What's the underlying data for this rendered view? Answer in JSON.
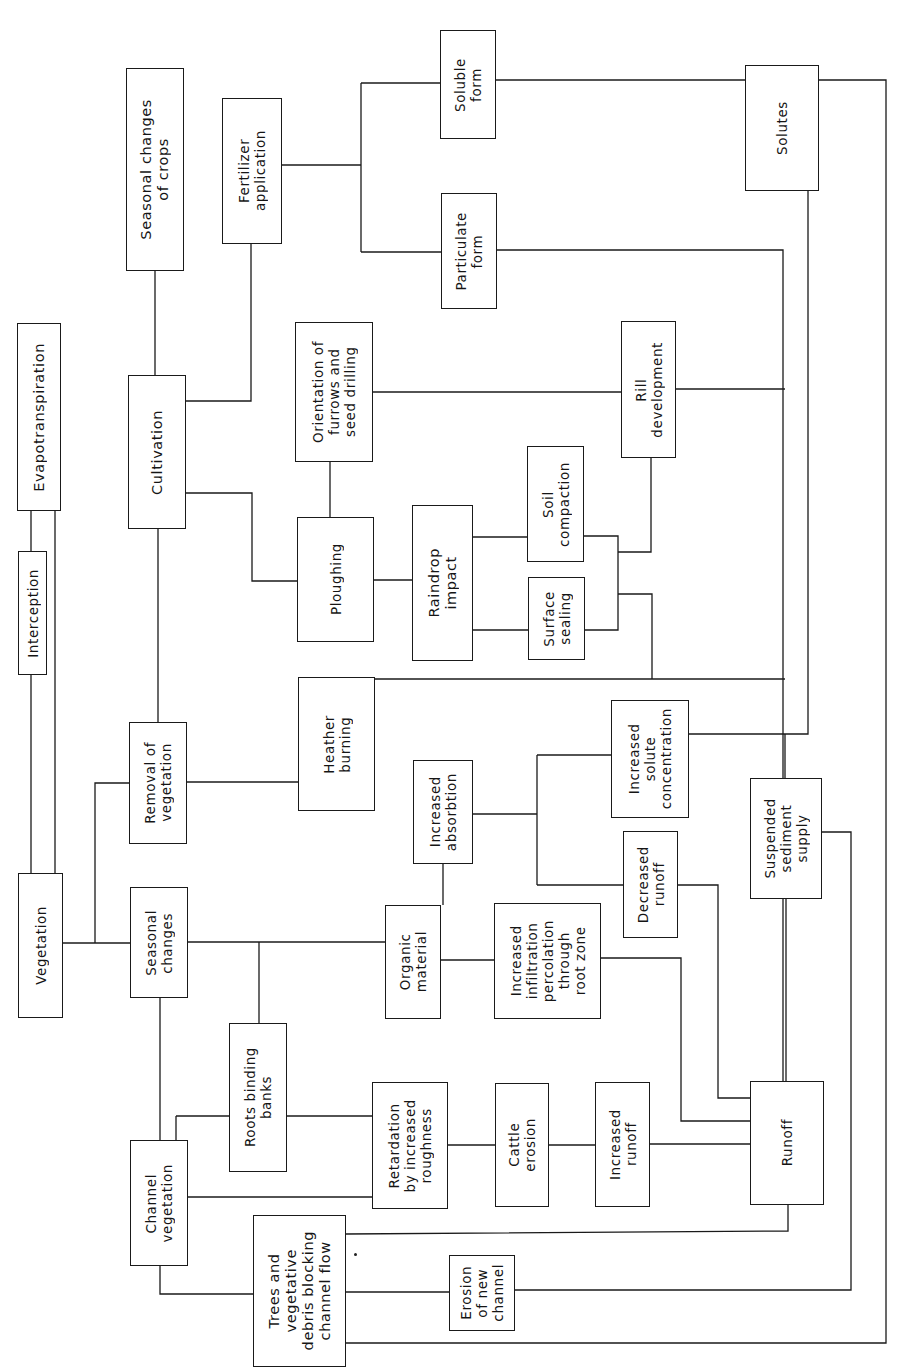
{
  "figure": {
    "orientation": "rotated 90° counter-clockwise (text reads bottom-to-top)",
    "line_color": "#1a1a1a",
    "background": "#ffffff"
  },
  "nodes": [
    {
      "id": "evapotranspiration",
      "label": "Evapotranspiration",
      "x": 17,
      "y": 323,
      "w": 44,
      "h": 188
    },
    {
      "id": "interception",
      "label": "Interception",
      "x": 18,
      "y": 551,
      "w": 29,
      "h": 124
    },
    {
      "id": "vegetation",
      "label": "Vegetation",
      "x": 18,
      "y": 873,
      "w": 45,
      "h": 145
    },
    {
      "id": "seasonal-changes-of-crops",
      "label": "Seasonal changes\nof crops",
      "x": 126,
      "y": 68,
      "w": 58,
      "h": 203
    },
    {
      "id": "cultivation",
      "label": "Cultivation",
      "x": 128,
      "y": 375,
      "w": 58,
      "h": 154
    },
    {
      "id": "removal-of-vegetation",
      "label": "Removal of\nvegetation",
      "x": 129,
      "y": 722,
      "w": 58,
      "h": 122
    },
    {
      "id": "seasonal-changes",
      "label": "Seasonal\nchanges",
      "x": 130,
      "y": 887,
      "w": 58,
      "h": 111
    },
    {
      "id": "channel-vegetation",
      "label": "Channel\nvegetation",
      "x": 130,
      "y": 1140,
      "w": 58,
      "h": 126
    },
    {
      "id": "fertilizer-application",
      "label": "Fertilizer\napplication",
      "x": 222,
      "y": 98,
      "w": 60,
      "h": 146
    },
    {
      "id": "orientation-of-furrows",
      "label": "Orientation of\nfurrows and\nseed drilling",
      "x": 295,
      "y": 322,
      "w": 78,
      "h": 140
    },
    {
      "id": "ploughing",
      "label": "Ploughing",
      "x": 297,
      "y": 517,
      "w": 77,
      "h": 125
    },
    {
      "id": "heather-burning",
      "label": "Heather\nburning",
      "x": 298,
      "y": 677,
      "w": 77,
      "h": 134
    },
    {
      "id": "roots-binding-banks",
      "label": "Roots binding\nbanks",
      "x": 229,
      "y": 1023,
      "w": 58,
      "h": 149
    },
    {
      "id": "trees-debris",
      "label": "Trees and\nvegetative\ndebris blocking\nchannel flow",
      "x": 253,
      "y": 1215,
      "w": 93,
      "h": 152
    },
    {
      "id": "soluble-form",
      "label": "Soluble\nform",
      "x": 440,
      "y": 30,
      "w": 56,
      "h": 109
    },
    {
      "id": "particulate-form",
      "label": "Particulate\nform",
      "x": 441,
      "y": 193,
      "w": 56,
      "h": 116
    },
    {
      "id": "raindrop-impact",
      "label": "Raindrop\nimpact",
      "x": 412,
      "y": 505,
      "w": 61,
      "h": 156
    },
    {
      "id": "soil-compaction",
      "label": "Soil\ncompaction",
      "x": 527,
      "y": 446,
      "w": 57,
      "h": 116
    },
    {
      "id": "surface-sealing",
      "label": "Surface\nsealing",
      "x": 528,
      "y": 577,
      "w": 57,
      "h": 83
    },
    {
      "id": "increased-absorbtion",
      "label": "Increased\nabsorbtion",
      "x": 413,
      "y": 760,
      "w": 60,
      "h": 104
    },
    {
      "id": "organic-material",
      "label": "Organic\nmaterial",
      "x": 385,
      "y": 905,
      "w": 56,
      "h": 114
    },
    {
      "id": "increased-infiltration",
      "label": "Increased\ninfiltration\npercolation\nthrough\nroot zone",
      "x": 494,
      "y": 903,
      "w": 107,
      "h": 116
    },
    {
      "id": "retardation",
      "label": "Retardation\nby increased\nroughness",
      "x": 372,
      "y": 1082,
      "w": 76,
      "h": 127
    },
    {
      "id": "cattle-erosion",
      "label": "Cattle\nerosion",
      "x": 495,
      "y": 1083,
      "w": 54,
      "h": 124
    },
    {
      "id": "increased-runoff",
      "label": "Increased\nrunoff",
      "x": 595,
      "y": 1082,
      "w": 55,
      "h": 125
    },
    {
      "id": "erosion-of-new-channel",
      "label": "Erosion\nof new\nchannel",
      "x": 449,
      "y": 1255,
      "w": 66,
      "h": 76
    },
    {
      "id": "rill-development",
      "label": "Rill\ndevelopment",
      "x": 621,
      "y": 321,
      "w": 55,
      "h": 137
    },
    {
      "id": "increased-solute-concentration",
      "label": "Increased\nsolute\nconcentration",
      "x": 611,
      "y": 700,
      "w": 78,
      "h": 118
    },
    {
      "id": "decreased-runoff",
      "label": "Decreased\nrunoff",
      "x": 623,
      "y": 831,
      "w": 55,
      "h": 107
    },
    {
      "id": "suspended-sediment-supply",
      "label": "Suspended\nsediment\nsupply",
      "x": 750,
      "y": 778,
      "w": 72,
      "h": 121
    },
    {
      "id": "solutes",
      "label": "Solutes",
      "x": 745,
      "y": 65,
      "w": 74,
      "h": 126
    },
    {
      "id": "runoff",
      "label": "Runoff",
      "x": 750,
      "y": 1081,
      "w": 74,
      "h": 124
    }
  ],
  "connectors": [
    "M 31 510 L 31 551",
    "M 55 510 L 55 873",
    "M 31 674 L 31 873",
    "M 63 943 L 130 943",
    "M 95 943 L 95 783 L 129 783",
    "M 155 270 L 155 375",
    "M 185 401 L 251 401 L 251 243",
    "M 186 493 L 252 493 L 252 581 L 297 581",
    "M 158 528 L 158 722",
    "M 187 782 L 298 782",
    "M 160 997 L 160 1140",
    "M 188 942 L 385 942",
    "M 259 942 L 259 1023",
    "M 282 165 L 361 165",
    "M 361 83 L 361 252",
    "M 361 83 L 440 83",
    "M 361 252 L 441 252",
    "M 373 392 L 621 392",
    "M 330 461 L 330 517",
    "M 374 580 L 412 580",
    "M 472 537 L 527 537",
    "M 472 630 L 528 630",
    "M 584 536 L 618 536 L 618 630 L 584 630",
    "M 618 552 L 651 552 L 651 457",
    "M 618 594 L 652 594 L 652 679",
    "M 375 679 L 785 679",
    "M 675 389 L 785 389",
    "M 496 250 L 783 250 L 783 1081",
    "M 496 80 L 745 80",
    "M 818 80 L 886 80 L 886 1343 L 346 1343",
    "M 808 190 L 808 734 L 688 734",
    "M 785 734 L 785 778",
    "M 473 814 L 537 814",
    "M 537 755 L 537 885",
    "M 537 755 L 611 755",
    "M 537 885 L 623 885",
    "M 678 885 L 718 885 L 718 1098 L 750 1098",
    "M 441 960 L 494 960",
    "M 443 905 L 443 863",
    "M 600 958 L 681 958 L 681 1121 L 750 1121",
    "M 822 832 L 851 832 L 851 1290 L 515 1290",
    "M 786 898 L 786 1081",
    "M 287 1116 L 372 1116",
    "M 176 1116 L 229 1116",
    "M 176 1116 L 176 1140",
    "M 188 1197 L 372 1197",
    "M 448 1145 L 495 1145",
    "M 549 1145 L 595 1145",
    "M 650 1144 L 750 1144",
    "M 788 1205 L 788 1231 L 346 1234",
    "M 160 1265 L 160 1294 L 253 1294",
    "M 346 1292 L 449 1292"
  ],
  "annotations": [
    {
      "type": "dot",
      "x": 354,
      "y": 1253
    }
  ]
}
